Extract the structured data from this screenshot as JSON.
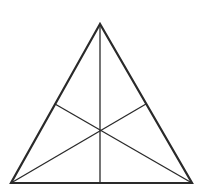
{
  "diagram": {
    "type": "triangle-with-medians",
    "canvas": {
      "width": 198,
      "height": 195,
      "background": "#ffffff"
    },
    "stroke_color": "#2a2a2a",
    "vertices": {
      "apex": [
        100,
        24
      ],
      "bottom_left": [
        11,
        183
      ],
      "bottom_right": [
        192,
        183
      ]
    },
    "midpoints": {
      "left_side": [
        55,
        104
      ],
      "right_side": [
        146,
        104
      ],
      "base": [
        100,
        183
      ]
    },
    "centroid": [
      100,
      130
    ],
    "outline_width": 2.2,
    "median_width": 1.3
  }
}
